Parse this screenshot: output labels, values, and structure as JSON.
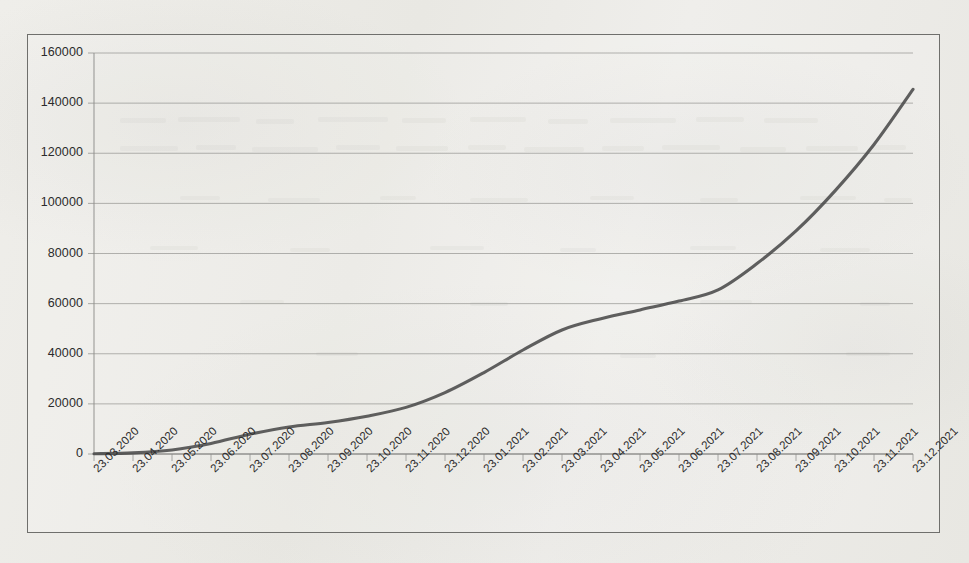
{
  "figure": {
    "background_color": "#ebeae6",
    "border_color": "#6f6f6c",
    "line_color": "#4a4a4a",
    "grid_color": "#8d8d8a",
    "text_color": "#2b2b2b"
  },
  "chart_data": {
    "type": "line",
    "title": "",
    "subtitle": "",
    "xlabel": "",
    "ylabel": "",
    "ylim": [
      0,
      160000
    ],
    "ytick_step": 20000,
    "grid": "horizontal",
    "legend": "none",
    "annotations": [],
    "yticks": [
      0,
      20000,
      40000,
      60000,
      80000,
      100000,
      120000,
      140000,
      160000
    ],
    "ytick_labels": [
      "0",
      "20000",
      "40000",
      "60000",
      "80000",
      "100000",
      "120000",
      "140000",
      "160000"
    ],
    "categories": [
      "23.03.2020",
      "23.04.2020",
      "23.05.2020",
      "23.06.2020",
      "23.07.2020",
      "23.08.2020",
      "23.09.2020",
      "23.10.2020",
      "23.11.2020",
      "23.12.2020",
      "23.01.2021",
      "23.02.2021",
      "23.03.2021",
      "23.04.2021",
      "23.05.2021",
      "23.06.2021",
      "23.07.2021",
      "23.08.2021",
      "23.09.2021",
      "23.10.2021",
      "23.11.2021",
      "23.12.2021"
    ],
    "series": [
      {
        "name": "cumulative",
        "values": [
          120,
          450,
          1600,
          4200,
          7900,
          10800,
          12600,
          15100,
          18600,
          24500,
          32500,
          41500,
          49500,
          54000,
          57500,
          61000,
          65500,
          76000,
          89000,
          105000,
          123500,
          145500
        ]
      }
    ]
  }
}
